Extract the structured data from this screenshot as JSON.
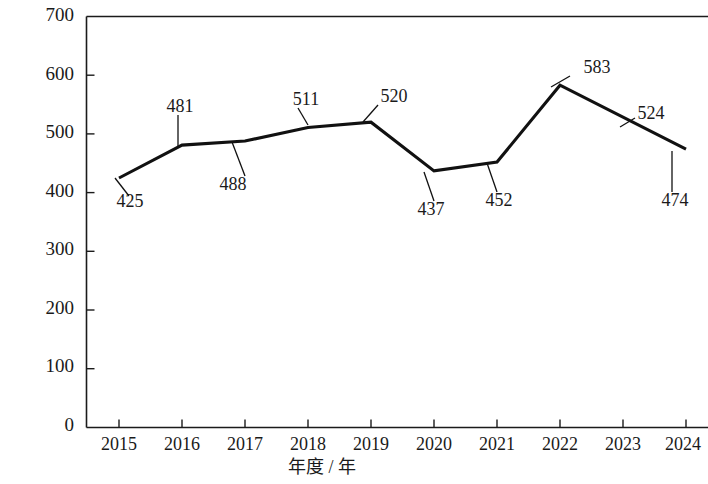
{
  "chart_data": {
    "type": "line",
    "title": "",
    "xlabel": "年度 / 年",
    "ylabel": "立项数量 / 项",
    "categories": [
      "2015",
      "2016",
      "2017",
      "2018",
      "2019",
      "2020",
      "2021",
      "2022",
      "2023",
      "2024"
    ],
    "values": [
      425,
      481,
      488,
      511,
      520,
      437,
      452,
      583,
      524,
      474
    ],
    "point_labels": [
      "425",
      "481",
      "488",
      "511",
      "520",
      "437",
      "452",
      "583",
      "524",
      "474"
    ],
    "label_positions": [
      "below",
      "above",
      "below",
      "above",
      "above",
      "below",
      "below",
      "above",
      "above",
      "below"
    ],
    "ylim": [
      0,
      700
    ],
    "yticks": [
      0,
      100,
      200,
      300,
      400,
      500,
      600,
      700
    ],
    "ytick_labels": [
      "0",
      "100",
      "200",
      "300",
      "400",
      "500",
      "600",
      "700"
    ],
    "xtick_labels": [
      "2015",
      "2016",
      "2017",
      "2018",
      "2019",
      "2020",
      "2021",
      "2022",
      "2023",
      "2024"
    ],
    "grid": false,
    "legend": null,
    "series_color": "#111111",
    "axis_color": "#1b1b1b",
    "background": "#ffffff"
  }
}
